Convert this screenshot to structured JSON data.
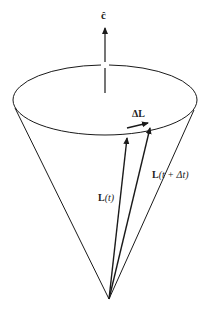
{
  "diagram": {
    "type": "precession-cone",
    "labels": {
      "axis": "ĉ",
      "delta_L": "ΔL",
      "L_t_bold": "L",
      "L_t_rest": "(t)",
      "L_tdt_bold": "L",
      "L_tdt_rest": "(t + Δt)"
    },
    "colors": {
      "stroke": "#1a1a1a",
      "background": "#ffffff"
    }
  }
}
